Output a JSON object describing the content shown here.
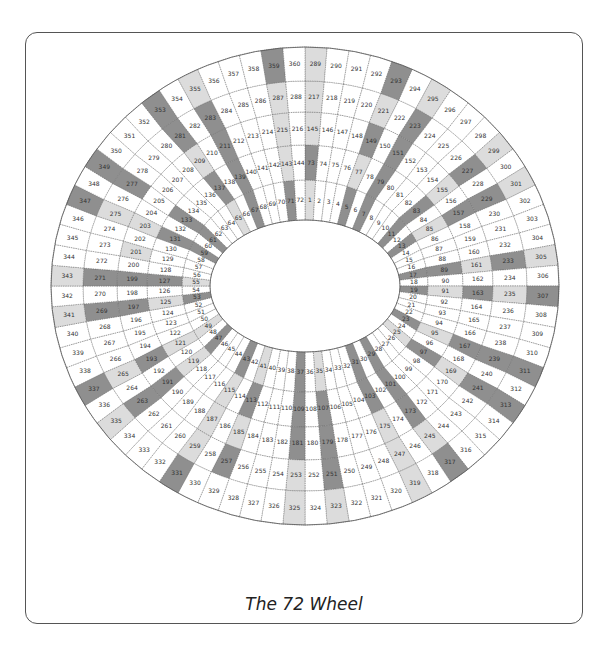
{
  "caption": "The 72 Wheel",
  "wheel": {
    "spokes": 72,
    "rings": 5,
    "numbering": "ring r (0=inner) spoke k (1..72 clockwise from top) => k + 72*r",
    "center": [
      305,
      286
    ],
    "ring_boundaries_rx": [
      95,
      123,
      158,
      188,
      222,
      254
    ],
    "ring_boundaries_ry": [
      66,
      106,
      141,
      174,
      205,
      239
    ],
    "colors": {
      "white": "#ffffff",
      "light": "#dcdcdc",
      "dark": "#8f8f8f",
      "line": "#666666"
    },
    "dark_cells": [
      5,
      7,
      11,
      13,
      17,
      19,
      23,
      29,
      31,
      37,
      43,
      47,
      53,
      59,
      61,
      67,
      71,
      73,
      79,
      83,
      89,
      97,
      101,
      103,
      107,
      109,
      113,
      127,
      131,
      133,
      137,
      139,
      149,
      151,
      157,
      163,
      167,
      173,
      179,
      181,
      191,
      193,
      197,
      199,
      211,
      223,
      227,
      229,
      233,
      239,
      241,
      251,
      257,
      263,
      269,
      271,
      277,
      281,
      283,
      293,
      307,
      311,
      313,
      317,
      331,
      337,
      347,
      349,
      353,
      359
    ],
    "light_cells": [
      1,
      25,
      35,
      41,
      49,
      55,
      65,
      77,
      85,
      91,
      95,
      115,
      119,
      121,
      125,
      143,
      145,
      155,
      161,
      169,
      175,
      185,
      187,
      201,
      203,
      209,
      215,
      217,
      221,
      235,
      245,
      247,
      253,
      259,
      265,
      275,
      287,
      289,
      295,
      299,
      301,
      305,
      319,
      323,
      325,
      335,
      341,
      343,
      355
    ]
  }
}
